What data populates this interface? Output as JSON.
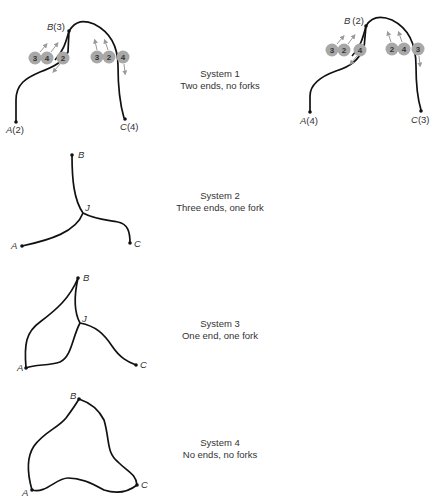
{
  "systems": [
    {
      "id": 1,
      "title": "System 1",
      "subtitle": "Two ends, no forks",
      "left_figure": {
        "nodes": [
          {
            "name": "B",
            "label": "B",
            "value": "(3)"
          },
          {
            "name": "A",
            "label": "A",
            "value": "(2)"
          },
          {
            "name": "C",
            "label": "C",
            "value": "(4)"
          }
        ],
        "left_cluster": [
          "3",
          "4",
          "2"
        ],
        "right_cluster": [
          "3",
          "2",
          "4"
        ]
      },
      "right_figure": {
        "nodes": [
          {
            "name": "B",
            "label": "B",
            "value": "(2)"
          },
          {
            "name": "A",
            "label": "A",
            "value": "(4)"
          },
          {
            "name": "C",
            "label": "C",
            "value": "(3)"
          }
        ],
        "left_cluster": [
          "3",
          "2",
          "4"
        ],
        "right_cluster": [
          "2",
          "4",
          "3"
        ]
      }
    },
    {
      "id": 2,
      "title": "System 2",
      "subtitle": "Three ends, one fork",
      "nodes": {
        "B": "B",
        "J": "J",
        "A": "A",
        "C": "C"
      }
    },
    {
      "id": 3,
      "title": "System 3",
      "subtitle": "One end, one fork",
      "nodes": {
        "B": "B",
        "J": "J",
        "A": "A",
        "C": "C"
      }
    },
    {
      "id": 4,
      "title": "System 4",
      "subtitle": "No ends, no forks",
      "nodes": {
        "B": "B",
        "A": "A",
        "C": "C"
      }
    }
  ],
  "colors": {
    "line": "#111111",
    "circle_fill": "#a8a8a8",
    "arrow": "#9a9a9a"
  }
}
